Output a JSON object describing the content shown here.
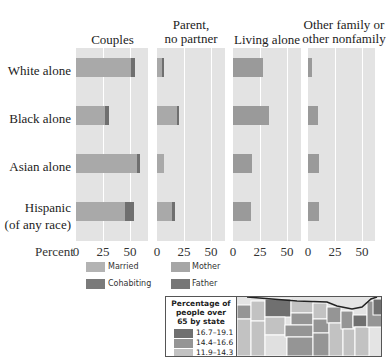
{
  "chart_data": {
    "type": "bar",
    "orientation": "horizontal",
    "layout": "small-multiples",
    "categories": [
      "White alone",
      "Black alone",
      "Asian alone",
      "Hispanic\n(of any race)"
    ],
    "xlabel": "Percent",
    "xticks": [
      0,
      25,
      50
    ],
    "xlim": [
      0,
      65
    ],
    "grid": true,
    "panels": [
      {
        "title": "Couples",
        "stacked": true,
        "series": [
          {
            "name": "Married",
            "color": "#a9a9a9",
            "values": [
              51,
              27,
              57,
              46
            ]
          },
          {
            "name": "Cohabiting",
            "color": "#6f6f6f",
            "values": [
              4,
              4,
              3,
              8
            ]
          }
        ]
      },
      {
        "title": "Parent, no partner",
        "stacked": true,
        "series": [
          {
            "name": "Mother",
            "color": "#a9a9a9",
            "values": [
              5,
              19,
              7,
              14
            ]
          },
          {
            "name": "Father",
            "color": "#6f6f6f",
            "values": [
              2,
              2,
              0,
              3
            ]
          }
        ]
      },
      {
        "title": "Living alone",
        "series": [
          {
            "name": "Living alone",
            "color": "#9a9a9a",
            "values": [
              28,
              34,
              18,
              17
            ]
          }
        ]
      },
      {
        "title": "Other family or other nonfamily",
        "series": [
          {
            "name": "Other",
            "color": "#9a9a9a",
            "values": [
              4,
              9,
              10,
              10
            ]
          }
        ]
      }
    ],
    "legend": [
      {
        "label": "Married",
        "color": "#b3b3b3"
      },
      {
        "label": "Cohabiting",
        "color": "#7a7a7a"
      },
      {
        "label": "Mother",
        "color": "#a6a6a6"
      },
      {
        "label": "Father",
        "color": "#777777"
      }
    ]
  },
  "panel_titles": {
    "couples": "Couples",
    "parent_l1": "Parent,",
    "parent_l2": "no partner",
    "living": "Living alone",
    "other_l1": "Other family or",
    "other_l2": "other nonfamily"
  },
  "row_labels": {
    "white": "White alone",
    "black": "Black alone",
    "asian": "Asian alone",
    "hispanic_l1": "Hispanic",
    "hispanic_l2": "(of any race)"
  },
  "axis": {
    "label": "Percent",
    "t0": "0",
    "t25": "25",
    "t50": "50"
  },
  "legend": {
    "married": "Married",
    "cohabiting": "Cohabiting",
    "mother": "Mother",
    "father": "Father"
  },
  "map_inset": {
    "title_l1": "Percentage of",
    "title_l2": "people over",
    "title_l3": "65 by state",
    "ranges": [
      "16.7–19.1",
      "14.4–16.6",
      "11.9–14.3"
    ],
    "colors": [
      "#707070",
      "#959595",
      "#c2c2c2"
    ]
  }
}
